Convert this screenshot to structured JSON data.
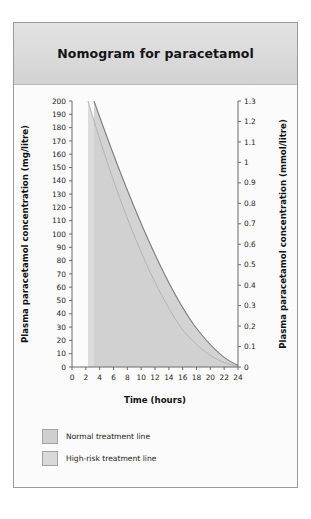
{
  "figure": {
    "title": "Nomogram for paracetamol"
  },
  "legend": {
    "items": [
      {
        "label": "Normal treatment line",
        "color": "#cfcfcf"
      },
      {
        "label": "High-risk treatment line",
        "color": "#d9d9d9"
      }
    ]
  },
  "chart_data": {
    "type": "line",
    "title": "Nomogram for paracetamol",
    "xlabel": "Time (hours)",
    "ylabel": "Plasma paracetamol concentration (mg/litre)",
    "ylabel_right": "Plasma paracetamol concentration (mmol/litre)",
    "xlim": [
      0,
      24
    ],
    "ylim": [
      0,
      200
    ],
    "ylim_right": [
      0,
      1.3
    ],
    "grid": false,
    "legend_position": "bottom-left",
    "x_ticks": [
      0,
      2,
      4,
      6,
      8,
      10,
      12,
      14,
      16,
      18,
      20,
      22,
      24
    ],
    "y_ticks_left": [
      0,
      10,
      20,
      30,
      40,
      50,
      60,
      70,
      80,
      90,
      100,
      110,
      120,
      130,
      140,
      150,
      160,
      170,
      180,
      190,
      200
    ],
    "y_ticks_right": [
      0,
      0.1,
      0.2,
      0.3,
      0.4,
      0.5,
      0.6,
      0.7,
      0.8,
      0.9,
      1,
      1.1,
      1.2,
      1.3
    ],
    "series": [
      {
        "name": "Normal treatment line",
        "x": [
          4,
          6,
          8,
          10,
          12,
          14,
          16,
          18,
          20,
          22,
          24
        ],
        "values": [
          200,
          150,
          113,
          85,
          63,
          48,
          36,
          27,
          20,
          15,
          11
        ]
      },
      {
        "name": "High-risk treatment line",
        "x": [
          4,
          6,
          8,
          10,
          12,
          14,
          16,
          18,
          20,
          22,
          24
        ],
        "values": [
          100,
          75,
          56,
          42,
          32,
          24,
          18,
          13,
          10,
          7.5,
          5.5
        ]
      }
    ],
    "annotations": [
      "Shaded region above each curve indicates the treatment zone",
      "Curves decline exponentially from 4 hours to 24 hours"
    ]
  }
}
